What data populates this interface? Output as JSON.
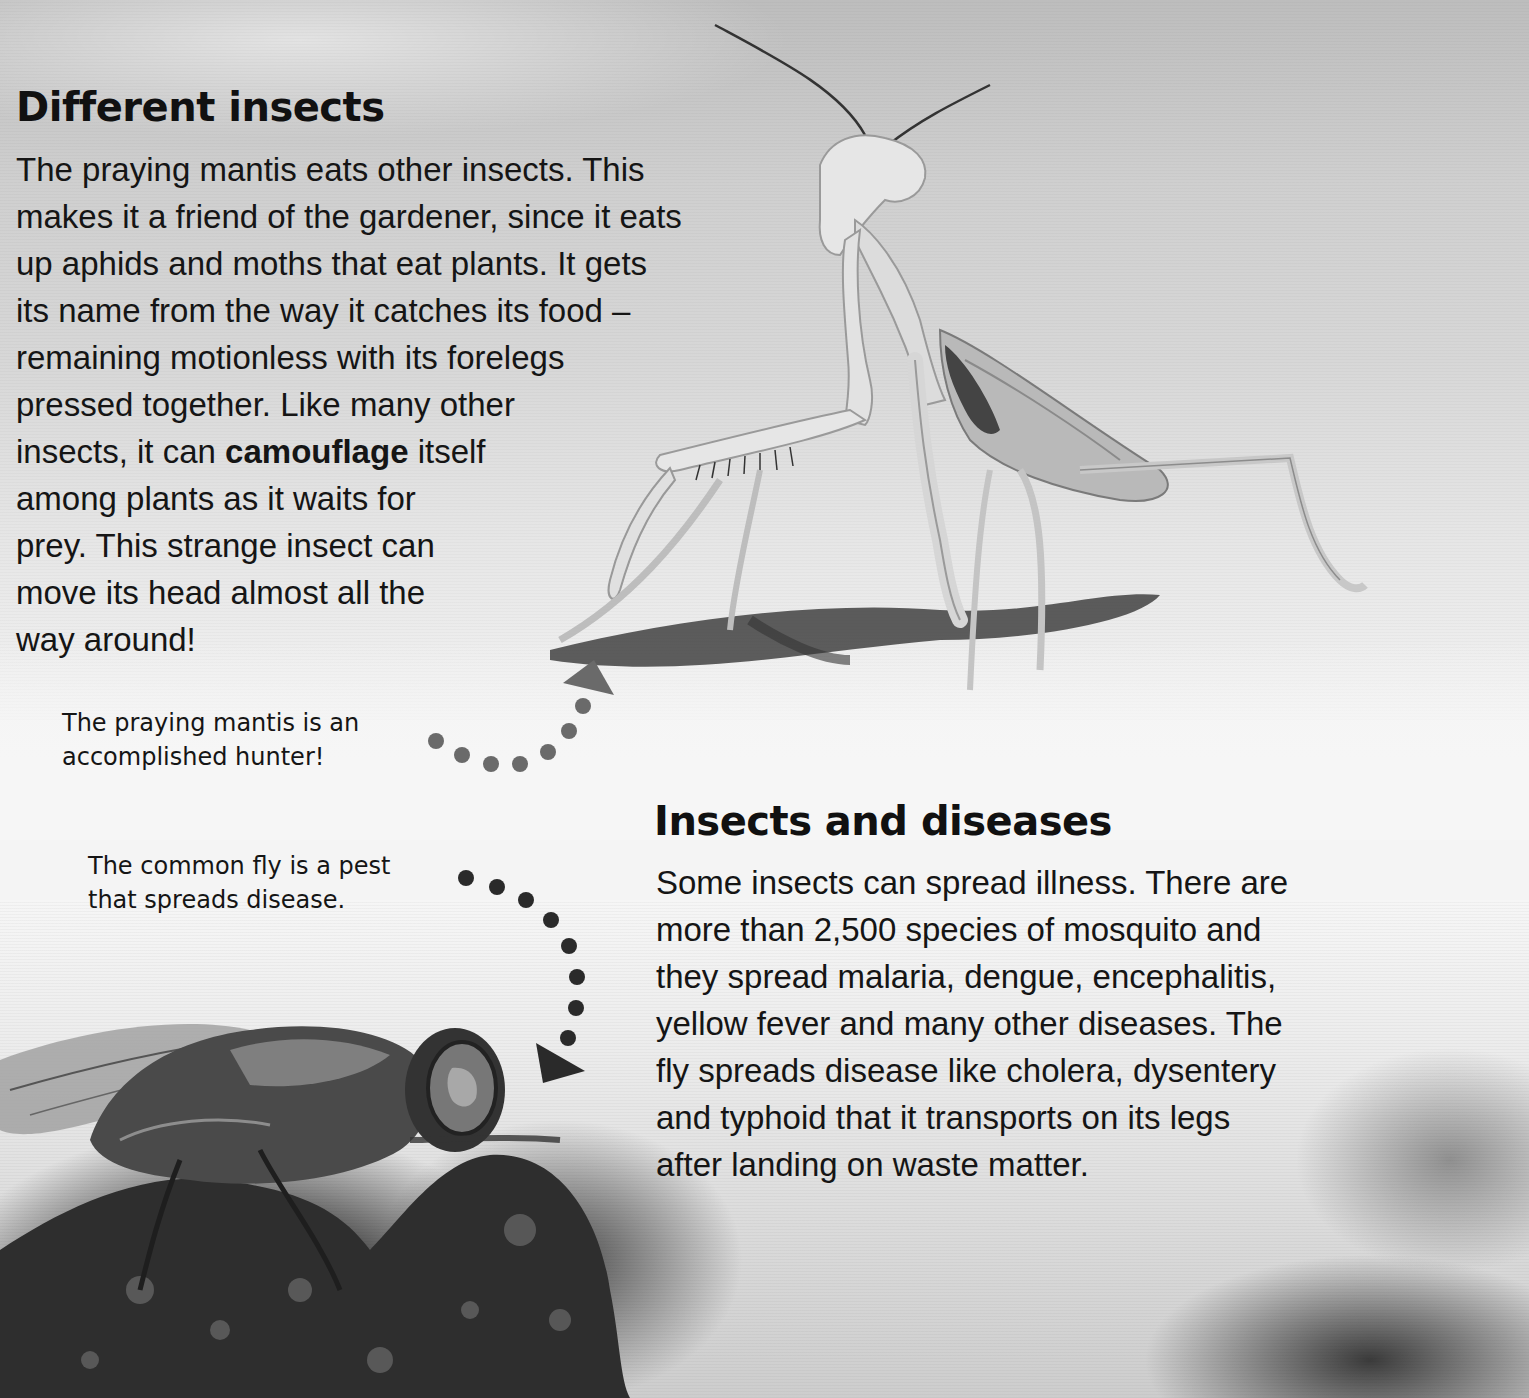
{
  "section_1": {
    "heading": "Different insects",
    "body_lines": [
      "The praying mantis eats other insects. This",
      "makes it a friend of the gardener, since it eats",
      "up aphids and moths that eat plants. It gets",
      "its name from the way it catches its food –",
      "remaining motionless with its forelegs",
      "pressed together. Like many other"
    ],
    "camouflage_line": {
      "before": "insects, it can ",
      "bold": "camouflage",
      "after": " itself"
    },
    "body_lines_end": [
      "among plants as it waits for",
      "prey. This strange insect can",
      "move its head almost all the",
      "way around!"
    ],
    "caption_lines": [
      "The praying mantis is an",
      "accomplished hunter!"
    ],
    "image": "praying-mantis-photo",
    "pointer_color": "#6a6a6a"
  },
  "section_2": {
    "heading": "Insects and diseases",
    "body_lines": [
      "Some insects can spread illness. There are",
      "more than 2,500 species of mosquito and",
      "they spread malaria, dengue, encephalitis,",
      "yellow fever and many other diseases. The",
      "fly spreads disease like cholera, dysentery",
      "and typhoid that it transports on its legs",
      "after landing on waste matter."
    ],
    "caption_lines": [
      "The common fly is a pest",
      "that spreads disease."
    ],
    "image": "common-fly-photo",
    "pointer_color": "#2a2a2a"
  }
}
